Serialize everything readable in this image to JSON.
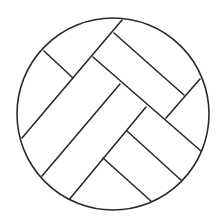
{
  "figure": {
    "width": 224,
    "height": 222,
    "background": "#ffffff",
    "stroke": "#2a2a2a",
    "stroke_width": 1.6,
    "circle": {
      "cx": 113,
      "cy": 114,
      "r": 96
    },
    "lines": [
      {
        "id": "diag-1",
        "x1": 122,
        "y1": 20,
        "x2": 22,
        "y2": 138
      },
      {
        "id": "diag-2",
        "x1": 120,
        "y1": 84,
        "x2": 42,
        "y2": 176
      },
      {
        "id": "diag-3",
        "x1": 146,
        "y1": 107,
        "x2": 68,
        "y2": 201
      },
      {
        "id": "diag-4",
        "x1": 200,
        "y1": 79,
        "x2": 166,
        "y2": 118
      },
      {
        "id": "anti-1",
        "x1": 44,
        "y1": 51,
        "x2": 73,
        "y2": 78
      },
      {
        "id": "anti-2",
        "x1": 114,
        "y1": 33,
        "x2": 184,
        "y2": 95
      },
      {
        "id": "anti-3",
        "x1": 93,
        "y1": 57,
        "x2": 201,
        "y2": 151
      },
      {
        "id": "anti-4",
        "x1": 127,
        "y1": 131,
        "x2": 182,
        "y2": 181
      },
      {
        "id": "anti-5",
        "x1": 103,
        "y1": 158,
        "x2": 152,
        "y2": 202
      }
    ]
  }
}
